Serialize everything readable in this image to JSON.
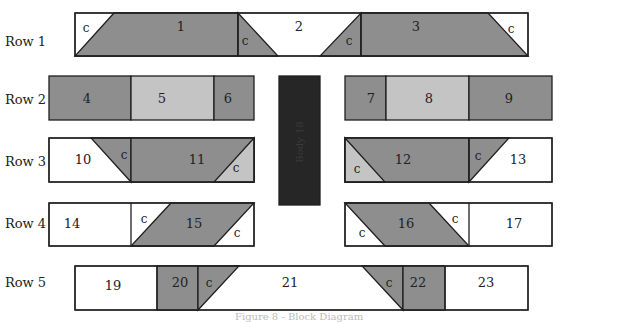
{
  "colors": {
    "background": "#ffffff",
    "dark_gray": "#8e8e8e",
    "light_gray": "#c4c4c4",
    "white": "#ffffff",
    "body_block": "#262626",
    "outline": "#1f1f1f"
  },
  "row_labels": [
    "Row 1",
    "Row 2",
    "Row 3",
    "Row 4",
    "Row 5"
  ],
  "body_block": {
    "label": "Body 18"
  },
  "corner_label": "c",
  "pieces": {
    "p1": "1",
    "p2": "2",
    "p3": "3",
    "p4": "4",
    "p5": "5",
    "p6": "6",
    "p7": "7",
    "p8": "8",
    "p9": "9",
    "p10": "10",
    "p11": "11",
    "p12": "12",
    "p13": "13",
    "p14": "14",
    "p15": "15",
    "p16": "16",
    "p17": "17",
    "p19": "19",
    "p20": "20",
    "p21": "21",
    "p22": "22",
    "p23": "23"
  },
  "caption": "Figure 8 - Block Diagram"
}
